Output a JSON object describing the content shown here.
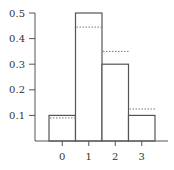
{
  "chart_data": {
    "type": "bar",
    "title": "",
    "xlabel": "",
    "ylabel": "",
    "categories": [
      "0",
      "1",
      "2",
      "3"
    ],
    "series": [
      {
        "name": "observed",
        "style": "solid",
        "values": [
          0.1,
          0.5,
          0.3,
          0.1
        ]
      },
      {
        "name": "reference",
        "style": "dashed",
        "values": [
          0.09,
          0.445,
          0.35,
          0.125
        ]
      }
    ],
    "yticks": [
      "0.1",
      "0.2",
      "0.3",
      "0.4",
      "0.5"
    ],
    "ylim": [
      0,
      0.5
    ],
    "grid": false,
    "legend": null
  }
}
